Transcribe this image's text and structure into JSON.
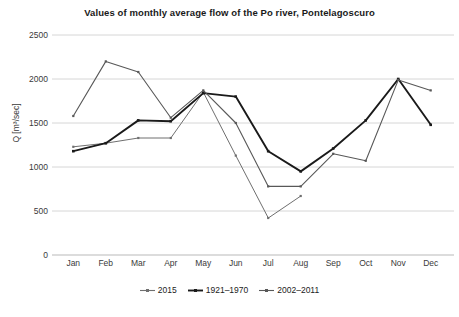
{
  "chart_data": {
    "type": "line",
    "title": "Values of monthly average flow of the Po river, Pontelagoscuro",
    "xlabel": "",
    "ylabel": "Q [m³/sec]",
    "categories": [
      "Jan",
      "Feb",
      "Mar",
      "Apr",
      "May",
      "Jun",
      "Jul",
      "Aug",
      "Sep",
      "Oct",
      "Nov",
      "Dec"
    ],
    "ylim": [
      0,
      2500
    ],
    "yticks": [
      0,
      500,
      1000,
      1500,
      2000,
      2500
    ],
    "ytick_labels": [
      "0",
      "500",
      "1000",
      "1500",
      "2000",
      "2500"
    ],
    "grid": true,
    "legend_position": "bottom",
    "series": [
      {
        "name": "2015",
        "color": "#6f6f6f",
        "values": [
          1230,
          1270,
          1330,
          1330,
          1850,
          1130,
          420,
          670,
          null,
          null,
          null,
          null
        ]
      },
      {
        "name": "1921–1970",
        "color": "#1a1a1a",
        "values": [
          1180,
          1270,
          1530,
          1520,
          1840,
          1800,
          1180,
          950,
          1210,
          1530,
          2000,
          1480
        ]
      },
      {
        "name": "2002–2011",
        "color": "#585858",
        "values": [
          1580,
          2200,
          2080,
          1560,
          1870,
          1500,
          780,
          780,
          1150,
          1070,
          1990,
          1870
        ]
      }
    ]
  },
  "legend": {
    "items": [
      {
        "label": "2015"
      },
      {
        "label": "1921–1970"
      },
      {
        "label": "2002–2011"
      }
    ]
  }
}
